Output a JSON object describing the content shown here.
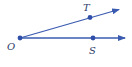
{
  "diagram": {
    "type": "angle",
    "colors": {
      "ray": "#3a5bb0",
      "point": "#2f4fa8",
      "label": "#2a3a66"
    },
    "vertex": {
      "label": "O",
      "x": 20,
      "y": 38
    },
    "rays": [
      {
        "name": "OT",
        "point_label": "T",
        "end": [
          120,
          9
        ],
        "point": [
          90,
          17
        ]
      },
      {
        "name": "OS",
        "point_label": "S",
        "end": [
          126,
          38
        ],
        "point": [
          93,
          38
        ]
      }
    ],
    "labels": {
      "o": "O",
      "t": "T",
      "s": "S"
    }
  }
}
